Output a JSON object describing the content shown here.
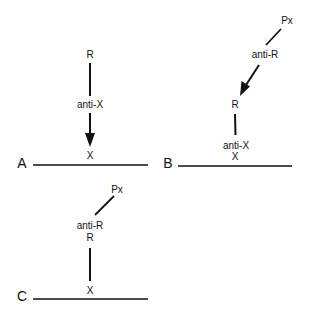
{
  "panels": {
    "A": {
      "label": "A",
      "nodes": {
        "top": "R",
        "middle": "anti-X",
        "surface": "X"
      },
      "arrows": [
        {
          "from": "R",
          "to": "X",
          "via": "anti-X",
          "arrowhead": true
        }
      ]
    },
    "B": {
      "label": "B",
      "nodes": {
        "top": "Px",
        "second": "anti-R",
        "third": "R",
        "fourth": "anti-X",
        "surface": "X"
      },
      "arrows": [
        {
          "from": "Px",
          "to": "R",
          "via": "anti-R",
          "arrowhead": true
        },
        {
          "from": "R",
          "to": "anti-X",
          "arrowhead": false
        }
      ]
    },
    "C": {
      "label": "C",
      "nodes": {
        "top": "Px",
        "second": "anti-R",
        "third": "R",
        "surface": "X"
      },
      "arrows": [
        {
          "from": "Px",
          "to": "anti-R",
          "arrowhead": false
        },
        {
          "from": "R",
          "to": "X",
          "arrowhead": false
        }
      ]
    }
  },
  "colors": {
    "ink": "#111111",
    "background": "#ffffff"
  }
}
